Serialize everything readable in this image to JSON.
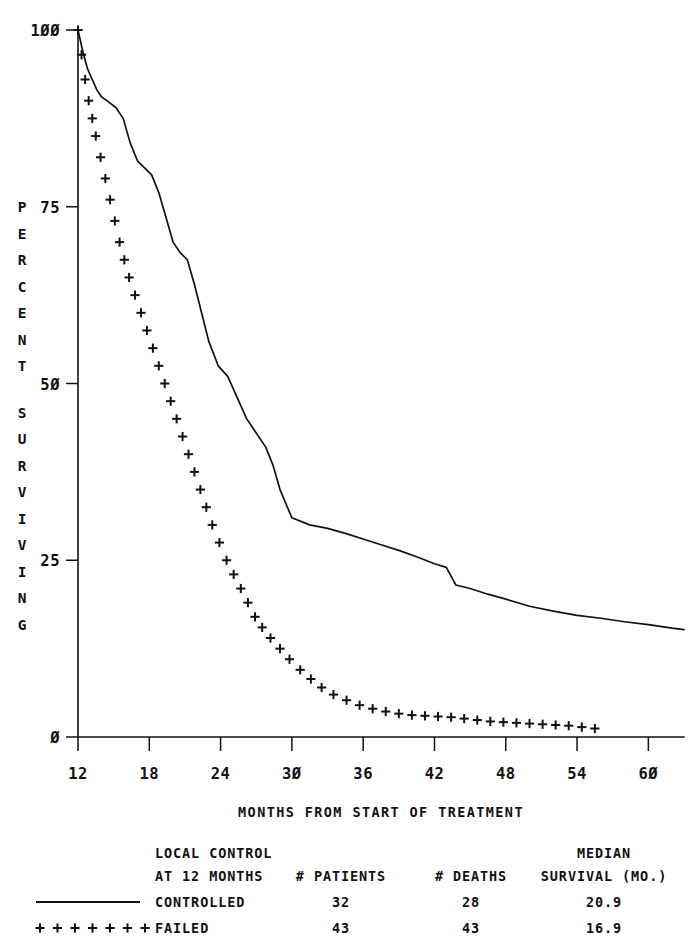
{
  "chart_data": {
    "type": "line",
    "title": "",
    "xlabel": "MONTHS FROM START OF TREATMENT",
    "ylabel": "PERCENT SURVIVING",
    "xlim": [
      12,
      63
    ],
    "ylim": [
      0,
      100
    ],
    "xticks": [
      12,
      18,
      24,
      30,
      36,
      42,
      48,
      54,
      60
    ],
    "xtick_labels": [
      "12",
      "18",
      "24",
      "30",
      "36",
      "42",
      "48",
      "54",
      "60"
    ],
    "yticks": [
      0,
      25,
      50,
      75,
      100
    ],
    "ytick_labels": [
      "0",
      "25",
      "50",
      "75",
      "100"
    ],
    "grid": false,
    "legend_position": "below-axes",
    "series": [
      {
        "name": "CONTROLLED",
        "style": "solid-line",
        "marker": "none",
        "x": [
          12.0,
          12.4,
          12.8,
          13.2,
          13.6,
          14.0,
          14.6,
          15.2,
          15.8,
          16.4,
          17.0,
          17.6,
          18.2,
          18.8,
          19.4,
          20.0,
          20.6,
          21.2,
          21.8,
          22.4,
          23.0,
          23.8,
          24.6,
          25.4,
          26.2,
          27.0,
          27.8,
          28.4,
          29.0,
          30.0,
          31.5,
          33.0,
          34.5,
          36.0,
          37.5,
          39.0,
          40.5,
          42.0,
          43.0,
          43.8,
          45.0,
          46.5,
          48.0,
          50.0,
          52.0,
          54.0,
          56.0,
          58.0,
          60.0,
          62.0,
          63.0
        ],
        "y": [
          100.0,
          97.0,
          94.5,
          93.0,
          91.5,
          90.5,
          89.8,
          89.0,
          87.5,
          84.0,
          81.5,
          80.5,
          79.5,
          77.0,
          73.5,
          70.0,
          68.5,
          67.5,
          64.0,
          60.0,
          56.0,
          52.5,
          51.0,
          48.0,
          45.0,
          43.0,
          41.0,
          38.5,
          35.0,
          31.0,
          30.0,
          29.5,
          28.8,
          28.0,
          27.2,
          26.4,
          25.5,
          24.5,
          24.0,
          21.5,
          21.0,
          20.2,
          19.5,
          18.5,
          17.8,
          17.2,
          16.8,
          16.3,
          15.9,
          15.4,
          15.2
        ]
      },
      {
        "name": "FAILED",
        "style": "plus-markers",
        "marker": "plus",
        "x": [
          12.0,
          12.3,
          12.6,
          12.9,
          13.2,
          13.5,
          13.9,
          14.3,
          14.7,
          15.1,
          15.5,
          15.9,
          16.3,
          16.8,
          17.3,
          17.8,
          18.3,
          18.8,
          19.3,
          19.8,
          20.3,
          20.8,
          21.3,
          21.8,
          22.3,
          22.8,
          23.3,
          23.9,
          24.5,
          25.1,
          25.7,
          26.3,
          26.9,
          27.5,
          28.2,
          29.0,
          29.8,
          30.7,
          31.6,
          32.5,
          33.5,
          34.6,
          35.7,
          36.8,
          37.9,
          39.0,
          40.1,
          41.2,
          42.3,
          43.4,
          44.5,
          45.6,
          46.7,
          47.8,
          48.9,
          50.0,
          51.1,
          52.2,
          53.3,
          54.4,
          55.5
        ],
        "y": [
          100.0,
          96.5,
          93.0,
          90.0,
          87.5,
          85.0,
          82.0,
          79.0,
          76.0,
          73.0,
          70.0,
          67.5,
          65.0,
          62.5,
          60.0,
          57.5,
          55.0,
          52.5,
          50.0,
          47.5,
          45.0,
          42.5,
          40.0,
          37.5,
          35.0,
          32.5,
          30.0,
          27.5,
          25.0,
          23.0,
          21.0,
          19.0,
          17.0,
          15.5,
          14.0,
          12.5,
          11.0,
          9.5,
          8.2,
          7.0,
          6.0,
          5.2,
          4.5,
          4.0,
          3.6,
          3.3,
          3.1,
          3.0,
          2.9,
          2.8,
          2.6,
          2.4,
          2.2,
          2.1,
          2.0,
          1.9,
          1.8,
          1.7,
          1.6,
          1.4,
          1.2
        ]
      }
    ]
  },
  "legend": {
    "header_line1": "LOCAL CONTROL",
    "header_line2": "AT 12 MONTHS",
    "col_patients": "# PATIENTS",
    "col_deaths": "# DEATHS",
    "col_median_line1": "MEDIAN",
    "col_median_line2": "SURVIVAL (MO.)",
    "rows": [
      {
        "group": "CONTROLLED",
        "swatch": "solid-line",
        "patients": "32",
        "deaths": "28",
        "median_survival": "20.9"
      },
      {
        "group": "FAILED",
        "swatch": "plus-markers",
        "patients": "43",
        "deaths": "43",
        "median_survival": "16.9"
      }
    ]
  },
  "style": {
    "ink": "#111111",
    "background": "#ffffff"
  }
}
